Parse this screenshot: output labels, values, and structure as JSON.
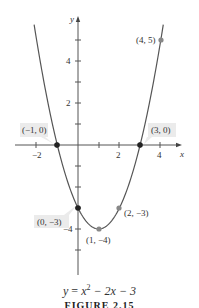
{
  "figure": {
    "equation": {
      "lhs": "y",
      "eq": " = ",
      "x": "x",
      "exp": "2",
      "rest": " − 2x − 3"
    },
    "figure_label": "FIGURE 2.15",
    "axes": {
      "x_label": "x",
      "y_label": "y",
      "x_tick_labels": [
        "−2",
        "2",
        "4"
      ],
      "y_tick_labels": [
        "4",
        "2",
        "−4"
      ]
    },
    "points": [
      {
        "label": "(4, 5)",
        "x": 4,
        "y": 5,
        "color": "#888888"
      },
      {
        "label": "(−1, 0)",
        "x": -1,
        "y": 0,
        "color": "#222222"
      },
      {
        "label": "(3, 0)",
        "x": 3,
        "y": 0,
        "color": "#222222"
      },
      {
        "label": "(0, −3)",
        "x": 0,
        "y": -3,
        "color": "#222222"
      },
      {
        "label": "(2, −3)",
        "x": 2,
        "y": -3,
        "color": "#888888"
      },
      {
        "label": "(1, −4)",
        "x": 1,
        "y": -4,
        "color": "#888888"
      }
    ]
  },
  "chart_data": {
    "type": "line",
    "title": "",
    "caption": "y = x^2 − 2x − 3",
    "function": "y = x^2 - 2x - 3",
    "xlabel": "x",
    "ylabel": "y",
    "xlim": [
      -2.8,
      4.5
    ],
    "ylim": [
      -5.4,
      6
    ],
    "x_ticks": [
      -2,
      -1,
      0,
      1,
      2,
      3,
      4
    ],
    "x_tick_labels": [
      "−2",
      "2",
      "4"
    ],
    "y_ticks": [
      -5,
      -4,
      -3,
      -2,
      -1,
      0,
      1,
      2,
      3,
      4,
      5
    ],
    "y_tick_labels": [
      "4",
      "2",
      "−4"
    ],
    "grid": false,
    "series": [
      {
        "name": "y = x^2 − 2x − 3",
        "x": [
          -2.1,
          -1,
          0,
          1,
          2,
          3,
          4,
          4.1
        ],
        "y": [
          4.61,
          0,
          -3,
          -4,
          -3,
          0,
          5,
          5.61
        ]
      }
    ],
    "annotations": [
      {
        "text": "(4, 5)",
        "x": 4,
        "y": 5
      },
      {
        "text": "(−1, 0)",
        "x": -1,
        "y": 0
      },
      {
        "text": "(3, 0)",
        "x": 3,
        "y": 0
      },
      {
        "text": "(0, −3)",
        "x": 0,
        "y": -3
      },
      {
        "text": "(2, −3)",
        "x": 2,
        "y": -3
      },
      {
        "text": "(1, −4)",
        "x": 1,
        "y": -4
      }
    ]
  }
}
